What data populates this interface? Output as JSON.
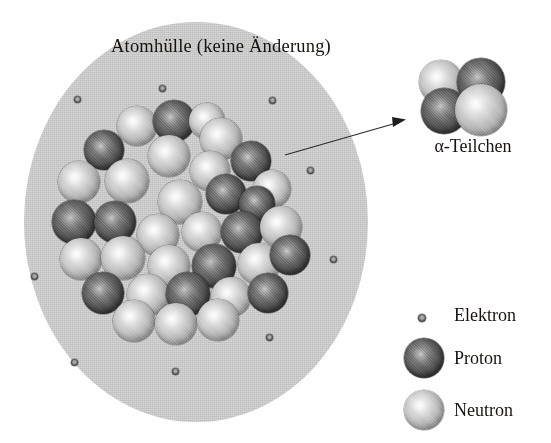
{
  "diagram": {
    "title": "Atomhülle (keine Änderung)",
    "alpha_particle_label": "α-Teilchen",
    "colors": {
      "shell_fill": "#c9c9c9",
      "proton": "#474747",
      "neutron": "#c2c2c2",
      "electron": "#3a3a3a",
      "text": "#17140f",
      "background": "#ffffff"
    }
  },
  "legend": {
    "items": [
      {
        "label": "Elektron",
        "marker": "electron-dot"
      },
      {
        "label": "Proton",
        "marker": "proton-sphere"
      },
      {
        "label": "Neutron",
        "marker": "neutron-sphere"
      }
    ]
  },
  "alpha_particle": {
    "composition": [
      {
        "type": "neutron",
        "position": "top-left"
      },
      {
        "type": "proton",
        "position": "top-right"
      },
      {
        "type": "proton",
        "position": "bottom-left"
      },
      {
        "type": "neutron",
        "position": "bottom-right"
      }
    ]
  },
  "electrons": [
    {
      "x": 74,
      "y": 96
    },
    {
      "x": 159,
      "y": 85
    },
    {
      "x": 269,
      "y": 97
    },
    {
      "x": 307,
      "y": 167
    },
    {
      "x": 31,
      "y": 273
    },
    {
      "x": 330,
      "y": 256
    },
    {
      "x": 71,
      "y": 359
    },
    {
      "x": 266,
      "y": 334
    },
    {
      "x": 172,
      "y": 368
    }
  ],
  "nucleus": {
    "nucleons": [
      {
        "t": "n",
        "x": 117,
        "y": 106,
        "d": 40
      },
      {
        "t": "p",
        "x": 153,
        "y": 100,
        "d": 42
      },
      {
        "t": "n",
        "x": 189,
        "y": 103,
        "d": 36
      },
      {
        "t": "n",
        "x": 200,
        "y": 118,
        "d": 42
      },
      {
        "t": "p",
        "x": 84,
        "y": 130,
        "d": 40
      },
      {
        "t": "n",
        "x": 148,
        "y": 135,
        "d": 42
      },
      {
        "t": "p",
        "x": 231,
        "y": 141,
        "d": 40
      },
      {
        "t": "n",
        "x": 190,
        "y": 151,
        "d": 40
      },
      {
        "t": "n",
        "x": 58,
        "y": 161,
        "d": 42
      },
      {
        "t": "n",
        "x": 105,
        "y": 159,
        "d": 44
      },
      {
        "t": "n",
        "x": 158,
        "y": 180,
        "d": 44
      },
      {
        "t": "p",
        "x": 206,
        "y": 174,
        "d": 40
      },
      {
        "t": "n",
        "x": 253,
        "y": 170,
        "d": 38
      },
      {
        "t": "p",
        "x": 239,
        "y": 186,
        "d": 36
      },
      {
        "t": "p",
        "x": 52,
        "y": 200,
        "d": 44
      },
      {
        "t": "p",
        "x": 94,
        "y": 201,
        "d": 42
      },
      {
        "t": "n",
        "x": 137,
        "y": 214,
        "d": 42
      },
      {
        "t": "n",
        "x": 182,
        "y": 212,
        "d": 40
      },
      {
        "t": "p",
        "x": 221,
        "y": 211,
        "d": 42
      },
      {
        "t": "n",
        "x": 260,
        "y": 206,
        "d": 42
      },
      {
        "t": "n",
        "x": 60,
        "y": 238,
        "d": 42
      },
      {
        "t": "n",
        "x": 101,
        "y": 236,
        "d": 44
      },
      {
        "t": "n",
        "x": 148,
        "y": 245,
        "d": 42
      },
      {
        "t": "p",
        "x": 192,
        "y": 244,
        "d": 44
      },
      {
        "t": "n",
        "x": 238,
        "y": 243,
        "d": 42
      },
      {
        "t": "p",
        "x": 270,
        "y": 235,
        "d": 40
      },
      {
        "t": "p",
        "x": 82,
        "y": 272,
        "d": 42
      },
      {
        "t": "n",
        "x": 127,
        "y": 274,
        "d": 42
      },
      {
        "t": "p",
        "x": 166,
        "y": 272,
        "d": 44
      },
      {
        "t": "n",
        "x": 211,
        "y": 277,
        "d": 40
      },
      {
        "t": "p",
        "x": 248,
        "y": 273,
        "d": 40
      },
      {
        "t": "n",
        "x": 113,
        "y": 300,
        "d": 42
      },
      {
        "t": "n",
        "x": 155,
        "y": 303,
        "d": 42
      },
      {
        "t": "n",
        "x": 197,
        "y": 299,
        "d": 42
      }
    ]
  }
}
